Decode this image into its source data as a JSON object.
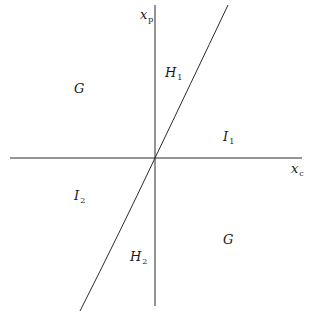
{
  "diagram": {
    "axes": {
      "vertical": {
        "label_main": "x",
        "label_sub": "p"
      },
      "horizontal": {
        "label_main": "x",
        "label_sub": "c"
      }
    },
    "regions": [
      {
        "id": "G_upper_left",
        "main": "G",
        "sub": ""
      },
      {
        "id": "H1",
        "main": "H",
        "sub": "1"
      },
      {
        "id": "I1",
        "main": "I",
        "sub": "1"
      },
      {
        "id": "I2",
        "main": "I",
        "sub": "2"
      },
      {
        "id": "H2",
        "main": "H",
        "sub": "2"
      },
      {
        "id": "G_lower_right",
        "main": "G",
        "sub": ""
      }
    ],
    "colors": {
      "line": "#2a2a2a",
      "background": "#ffffff"
    }
  }
}
